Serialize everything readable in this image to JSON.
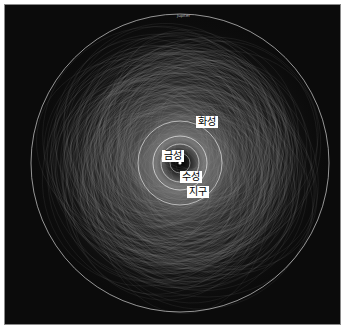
{
  "diagram": {
    "type": "orbit-plot",
    "background": "#0b0b0b",
    "orbit_color": "#d9d9d9",
    "outer_label": "Jupiter",
    "planets": [
      {
        "label": "화성",
        "x": 196,
        "y": 116
      },
      {
        "label": "금성",
        "x": 161,
        "y": 149
      },
      {
        "label": "수성",
        "x": 179,
        "y": 169
      },
      {
        "label": "지구",
        "x": 186,
        "y": 184
      }
    ]
  }
}
